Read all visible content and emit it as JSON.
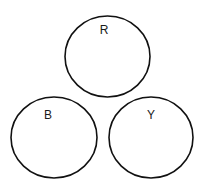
{
  "diagram": {
    "stroke_color": "#111111",
    "background": "#ffffff",
    "circles": [
      {
        "label": "R",
        "cx": 107.5,
        "cy": 56.5,
        "rx": 42.5,
        "ry": 40.5,
        "label_x": 104,
        "label_y": 34
      },
      {
        "label": "B",
        "cx": 54,
        "cy": 137.5,
        "rx": 43,
        "ry": 40.5,
        "label_x": 48,
        "label_y": 119
      },
      {
        "label": "Y",
        "cx": 151,
        "cy": 137.5,
        "rx": 42,
        "ry": 40.5,
        "label_x": 151,
        "label_y": 119
      }
    ]
  }
}
